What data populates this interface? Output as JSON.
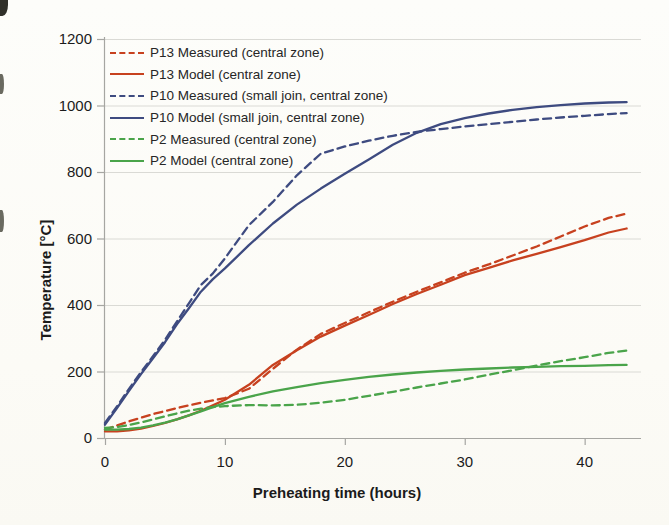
{
  "chart_data": {
    "type": "line",
    "title": "",
    "xlabel": "Preheating time (hours)",
    "ylabel": "Temperature [°C]",
    "xlim": [
      0,
      44.7
    ],
    "ylim": [
      0,
      1200
    ],
    "xticks": [
      0,
      10,
      20,
      30,
      40
    ],
    "yticks": [
      0,
      200,
      400,
      600,
      800,
      1000,
      1200
    ],
    "grid": "horizontal",
    "legend_position": "top-left-inside",
    "axis_color": "#a6a6a2",
    "grid_color": "#dadad5",
    "tick_label_color": "#1b1b1b",
    "x": [
      0,
      1,
      2,
      3,
      4,
      5,
      6,
      7,
      8,
      9,
      10,
      12,
      14,
      16,
      18,
      20,
      22,
      24,
      26,
      28,
      30,
      32,
      34,
      36,
      38,
      40,
      42,
      43.5
    ],
    "series": [
      {
        "name": "P13 Measured (central zone)",
        "style": "dashed",
        "color": "#c7411f",
        "values": [
          25,
          38,
          50,
          61,
          72,
          81,
          90,
          98,
          106,
          113,
          120,
          148,
          208,
          266,
          313,
          346,
          378,
          410,
          440,
          468,
          497,
          522,
          549,
          576,
          606,
          636,
          662,
          675
        ]
      },
      {
        "name": "P13 Model (central zone)",
        "style": "solid",
        "color": "#c7411f",
        "values": [
          20,
          20,
          23,
          28,
          36,
          45,
          56,
          68,
          82,
          98,
          115,
          160,
          220,
          264,
          305,
          338,
          370,
          403,
          433,
          461,
          490,
          512,
          534,
          554,
          574,
          595,
          618,
          630
        ]
      },
      {
        "name": "P10 Measured (small join, central zone)",
        "style": "dashed",
        "color": "#3e4b80",
        "values": [
          45,
          95,
          148,
          198,
          246,
          295,
          350,
          405,
          460,
          495,
          540,
          640,
          710,
          790,
          855,
          877,
          894,
          909,
          921,
          929,
          937,
          944,
          951,
          958,
          964,
          969,
          974,
          977
        ]
      },
      {
        "name": "P10 Model (small join, central zone)",
        "style": "solid",
        "color": "#3e4b80",
        "values": [
          40,
          90,
          142,
          192,
          240,
          288,
          342,
          390,
          440,
          478,
          510,
          580,
          645,
          702,
          750,
          795,
          838,
          882,
          918,
          944,
          962,
          976,
          987,
          995,
          1001,
          1006,
          1009,
          1010
        ]
      },
      {
        "name": "P2 Measured (central zone)",
        "style": "dashed",
        "color": "#4aa44a",
        "values": [
          30,
          33,
          39,
          47,
          56,
          65,
          74,
          82,
          88,
          93,
          96,
          99,
          98,
          100,
          106,
          115,
          127,
          139,
          152,
          164,
          176,
          190,
          204,
          218,
          231,
          243,
          256,
          263
        ]
      },
      {
        "name": "P2 Model (central zone)",
        "style": "solid",
        "color": "#4aa44a",
        "values": [
          25,
          25,
          27,
          31,
          38,
          46,
          56,
          68,
          80,
          93,
          105,
          124,
          140,
          153,
          165,
          175,
          184,
          191,
          197,
          202,
          206,
          209,
          212,
          214,
          216,
          217,
          219,
          220
        ]
      }
    ]
  }
}
